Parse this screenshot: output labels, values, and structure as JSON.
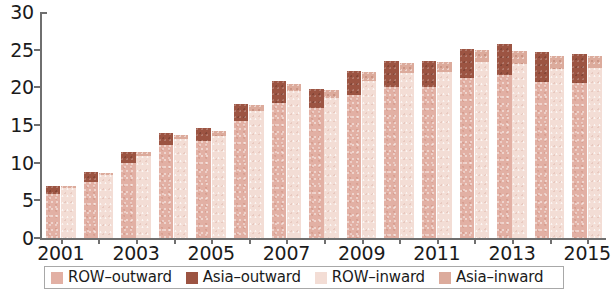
{
  "chart_data": {
    "type": "bar",
    "title": "",
    "subtitle": "",
    "xlabel": "",
    "ylabel": "",
    "ylim": [
      0,
      30
    ],
    "y_ticks": [
      0,
      5,
      10,
      15,
      20,
      25,
      30
    ],
    "x_tick_labels": [
      "2001",
      "2003",
      "2005",
      "2007",
      "2009",
      "2011",
      "2013",
      "2015"
    ],
    "grid": false,
    "legend_position": "bottom",
    "stacked": true,
    "grouped": true,
    "categories": [
      "2001",
      "2002",
      "2003",
      "2004",
      "2005",
      "2006",
      "2007",
      "2008",
      "2009",
      "2010",
      "2011",
      "2012",
      "2013",
      "2014",
      "2015"
    ],
    "groups": [
      {
        "name": "outward",
        "series": [
          {
            "name": "ROW-outward",
            "color": "#e2b0a4",
            "values": [
              5.9,
              7.5,
              9.9,
              12.3,
              12.9,
              15.5,
              17.9,
              17.3,
              19.0,
              20.0,
              20.1,
              21.3,
              21.6,
              20.7,
              20.6
            ]
          },
          {
            "name": "Asia-outward",
            "color": "#9c5442",
            "values": [
              1.0,
              1.2,
              1.5,
              1.6,
              1.7,
              2.3,
              2.9,
              2.5,
              3.2,
              3.5,
              3.4,
              3.8,
              4.1,
              4.0,
              3.8
            ]
          }
        ]
      },
      {
        "name": "inward",
        "series": [
          {
            "name": "ROW-inward",
            "color": "#f3ddd5",
            "values": [
              6.6,
              8.3,
              10.9,
              13.1,
              13.5,
              16.9,
              19.5,
              18.6,
              20.8,
              21.9,
              22.0,
              23.3,
              23.1,
              22.5,
              22.6
            ]
          },
          {
            "name": "Asia-inward",
            "color": "#dcab9c",
            "values": [
              0.3,
              0.3,
              0.5,
              0.6,
              0.7,
              0.8,
              1.0,
              1.0,
              1.2,
              1.3,
              1.4,
              1.6,
              1.7,
              1.7,
              1.6
            ]
          }
        ]
      }
    ],
    "totals": {
      "outward": [
        6.9,
        8.7,
        11.4,
        13.9,
        14.6,
        17.8,
        20.8,
        19.8,
        22.2,
        23.5,
        23.5,
        25.1,
        25.7,
        24.7,
        24.4
      ],
      "inward": [
        6.9,
        8.6,
        11.4,
        13.7,
        14.2,
        17.7,
        20.5,
        19.6,
        22.0,
        23.2,
        23.4,
        24.9,
        24.8,
        24.2,
        24.2
      ]
    }
  },
  "legend": {
    "items": [
      {
        "label": "ROW–outward",
        "swatch": "#e2b0a4",
        "icon": "legend-swatch-row-outward"
      },
      {
        "label": "Asia–outward",
        "swatch": "#9c5442",
        "icon": "legend-swatch-asia-outward"
      },
      {
        "label": "ROW–inward",
        "swatch": "#f3ddd5",
        "icon": "legend-swatch-row-inward"
      },
      {
        "label": "Asia–inward",
        "swatch": "#dcab9c",
        "icon": "legend-swatch-asia-inward"
      }
    ]
  },
  "axis_colors": {
    "axis_line": "#6f6f6f",
    "text": "#1b1b1b"
  }
}
